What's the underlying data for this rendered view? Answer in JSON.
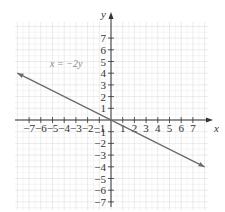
{
  "chart_data": {
    "type": "line",
    "title": "",
    "xlabel": "x",
    "ylabel": "y",
    "xlim": [
      -8,
      8
    ],
    "ylim": [
      -8,
      8
    ],
    "grid": true,
    "x_ticks": [
      -7,
      -6,
      -5,
      -4,
      -3,
      -2,
      -1,
      1,
      2,
      3,
      4,
      5,
      6,
      7
    ],
    "y_ticks": [
      -7,
      -6,
      -5,
      -4,
      -3,
      -2,
      -1,
      1,
      2,
      3,
      4,
      5,
      6,
      7
    ],
    "x_tick_labels": [
      "−7",
      "−6",
      "−5",
      "−4",
      "−3",
      "−2",
      "−1",
      "1",
      "2",
      "3",
      "4",
      "5",
      "6",
      "7"
    ],
    "y_tick_labels": [
      "−7",
      "−6",
      "−5",
      "−4",
      "−3",
      "−2",
      "−1",
      "1",
      "2",
      "3",
      "4",
      "5",
      "6",
      "7"
    ],
    "series": [
      {
        "name": "x = −2y",
        "equation": "x = -2y",
        "x": [
          -8,
          8
        ],
        "y": [
          4,
          -4
        ],
        "arrows": "both",
        "color": "#6b6b6b"
      }
    ],
    "annotations": [
      {
        "text": "x = −2y",
        "x": -4,
        "y": 4.7
      }
    ]
  },
  "colors": {
    "axis": "#333333",
    "grid_minor": "#eeeeee",
    "grid_major": "#dddddd",
    "line": "#6b6b6b",
    "label": "#888888"
  }
}
